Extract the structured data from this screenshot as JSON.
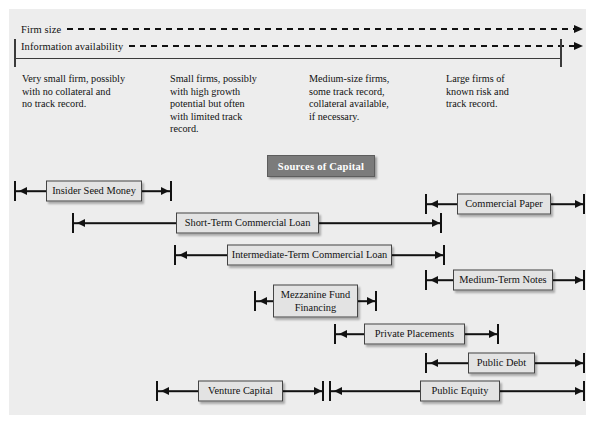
{
  "figure": {
    "title_chip": "Sources of Capital",
    "axes": [
      {
        "label": "Firm size"
      },
      {
        "label": "Information availability"
      }
    ],
    "columns": [
      {
        "text": "Very small firm, possibly\nwith no collateral and\nno track record."
      },
      {
        "text": "Small firms, possibly\nwith high growth\npotential but often\nwith limited track\nrecord."
      },
      {
        "text": "Medium-size firms,\nsome track record,\ncollateral available,\nif necessary."
      },
      {
        "text": "Large firms of\nknown risk and\ntrack record."
      }
    ],
    "sources": [
      {
        "label": "Insider Seed Money"
      },
      {
        "label": "Commercial Paper"
      },
      {
        "label": "Short-Term Commercial Loan"
      },
      {
        "label": "Intermediate-Term Commercial Loan"
      },
      {
        "label": "Medium-Term Notes"
      },
      {
        "label": "Mezzanine Fund\nFinancing"
      },
      {
        "label": "Private Placements"
      },
      {
        "label": "Public Debt"
      },
      {
        "label": "Venture Capital"
      },
      {
        "label": "Public Equity"
      }
    ]
  }
}
